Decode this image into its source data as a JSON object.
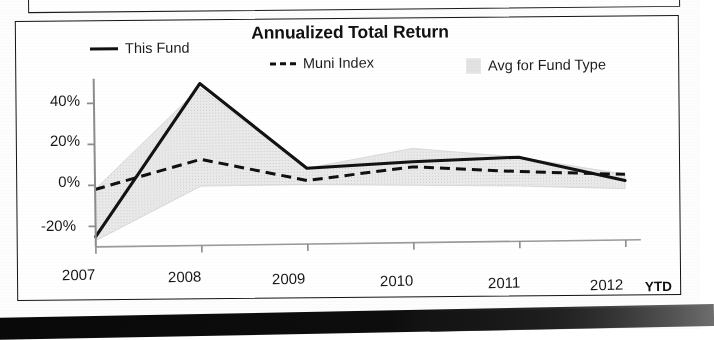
{
  "chart": {
    "title": "Annualized Total Return",
    "legend": [
      {
        "label": "This Fund",
        "marker": "solid-line-swatch",
        "color": "#111111"
      },
      {
        "label": "Muni Index",
        "marker": "dashed-line-swatch",
        "color": "#111111"
      },
      {
        "label": "Avg for Fund Type",
        "marker": "gray-area-swatch",
        "color": "#e2e2e2"
      }
    ],
    "y_ticks": [
      "40%",
      "20%",
      "0%",
      "-20%"
    ],
    "x_ticks": [
      "2007",
      "2008",
      "2009",
      "2010",
      "2011",
      "2012"
    ],
    "x_suffix": "YTD"
  },
  "chart_data": {
    "type": "line",
    "title": "Annualized Total Return",
    "xlabel": "",
    "ylabel": "",
    "categories": [
      "2007",
      "2008",
      "2009",
      "2010",
      "2011",
      "2012 YTD"
    ],
    "x": [
      2007,
      2008,
      2009,
      2010,
      2011,
      2012
    ],
    "ylim": [
      -30,
      52
    ],
    "yticks": [
      -20,
      0,
      20,
      40
    ],
    "ytick_labels": [
      "-20%",
      "0%",
      "20%",
      "40%"
    ],
    "grid": false,
    "legend_position": "top",
    "units": "percent",
    "series": [
      {
        "name": "This Fund",
        "style": "solid",
        "color": "#111111",
        "values": [
          -25,
          49,
          7,
          9.5,
          11,
          -1
        ]
      },
      {
        "name": "Muni Index",
        "style": "dashed",
        "color": "#111111",
        "values": [
          -2,
          12,
          1,
          7,
          4,
          2
        ]
      },
      {
        "name": "Avg for Fund Type",
        "style": "area-band",
        "color": "#e2e2e2",
        "upper": [
          -2,
          47,
          7,
          16,
          11,
          2
        ],
        "lower": [
          -27,
          -1,
          -1,
          -2,
          -3,
          -5
        ]
      }
    ]
  }
}
